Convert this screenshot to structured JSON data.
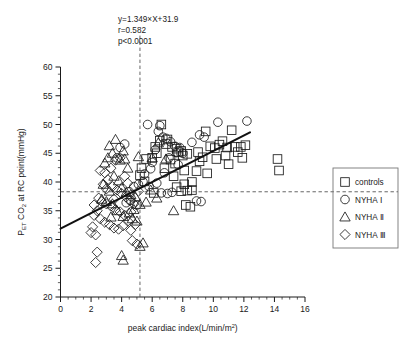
{
  "chart_data": {
    "type": "scatter",
    "title": "",
    "xlabel": "peak cardiac index(L/min/m2)",
    "xlabel_main": "peak cardiac index(L/min/m",
    "xlabel_sup": "2",
    "xlabel_tail": ")",
    "ylabel_pre": "P",
    "ylabel_sub1": "ET",
    "ylabel_mid": " CO",
    "ylabel_sub2": "2",
    "ylabel_tail": " at RC point(mmHg)",
    "xlim": [
      0,
      16
    ],
    "ylim": [
      20,
      60
    ],
    "xticks": [
      0,
      2,
      4,
      6,
      8,
      10,
      12,
      14,
      16
    ],
    "yticks": [
      20,
      25,
      30,
      35,
      40,
      45,
      50,
      55,
      60
    ],
    "xtick_labels": [
      "0",
      "2",
      "4",
      "6",
      "8",
      "10",
      "12",
      "14",
      "16"
    ],
    "ytick_labels": [
      "20",
      "25",
      "30",
      "35",
      "40",
      "45",
      "50",
      "55",
      "60"
    ],
    "minor_tick_step_x": 0.5,
    "minor_tick_step_y": 1.25,
    "grid": false,
    "legend_position": "right-outside",
    "annotations": {
      "equation": "y=1.349×X+31.9",
      "r": "r=0.582",
      "p": "p<0.0001"
    },
    "regression": {
      "slope": 1.349,
      "intercept": 31.9,
      "x_start": 0,
      "x_end": 12.4,
      "color": "#111111",
      "width": 2.1
    },
    "reference_lines": [
      {
        "name": "horizontal-threshold",
        "orientation": "horizontal",
        "value": 38.3,
        "style": "dashed"
      },
      {
        "name": "vertical-threshold",
        "orientation": "vertical",
        "value": 5.2,
        "style": "dashed"
      }
    ],
    "series": [
      {
        "name": "controls",
        "marker": "square",
        "points": [
          [
            6.6,
            50.0
          ],
          [
            6.5,
            47.2
          ],
          [
            6.9,
            46.6
          ],
          [
            7.3,
            46.1
          ],
          [
            7.6,
            45.8
          ],
          [
            7.7,
            45.2
          ],
          [
            7.9,
            45.4
          ],
          [
            8.0,
            44.6
          ],
          [
            8.3,
            44.9
          ],
          [
            7.2,
            43.9
          ],
          [
            7.5,
            43.2
          ],
          [
            6.8,
            42.4
          ],
          [
            8.1,
            42.0
          ],
          [
            8.9,
            41.9
          ],
          [
            9.0,
            45.2
          ],
          [
            9.3,
            44.3
          ],
          [
            9.5,
            48.8
          ],
          [
            9.8,
            46.2
          ],
          [
            10.1,
            45.9
          ],
          [
            10.4,
            46.5
          ],
          [
            10.6,
            47.1
          ],
          [
            10.9,
            46.0
          ],
          [
            11.2,
            49.0
          ],
          [
            11.4,
            46.1
          ],
          [
            11.6,
            45.2
          ],
          [
            11.8,
            46.1
          ],
          [
            11.9,
            44.2
          ],
          [
            12.1,
            46.4
          ],
          [
            10.2,
            44.0
          ],
          [
            9.1,
            43.6
          ],
          [
            8.6,
            40.0
          ],
          [
            8.1,
            39.6
          ],
          [
            8.3,
            38.5
          ],
          [
            7.9,
            38.4
          ],
          [
            8.6,
            38.6
          ],
          [
            8.2,
            36.0
          ],
          [
            8.5,
            35.7
          ],
          [
            14.2,
            44.0
          ],
          [
            14.3,
            42.0
          ],
          [
            6.3,
            45.0
          ],
          [
            6.2,
            46.1
          ],
          [
            7.0,
            47.4
          ],
          [
            7.4,
            41.0
          ],
          [
            9.6,
            41.5
          ],
          [
            10.8,
            44.6
          ],
          [
            11.0,
            43.1
          ],
          [
            6.0,
            44.2
          ],
          [
            5.6,
            44.0
          ],
          [
            5.3,
            42.4
          ],
          [
            5.2,
            41.2
          ],
          [
            5.5,
            40.1
          ],
          [
            6.1,
            38.1
          ],
          [
            7.6,
            39.1
          ]
        ]
      },
      {
        "name": "NYHA Ⅰ",
        "marker": "circle",
        "points": [
          [
            5.7,
            50.0
          ],
          [
            6.5,
            49.8
          ],
          [
            6.4,
            48.8
          ],
          [
            6.9,
            47.6
          ],
          [
            7.2,
            47.0
          ],
          [
            7.5,
            46.2
          ],
          [
            7.6,
            45.1
          ],
          [
            7.8,
            46.0
          ],
          [
            8.0,
            45.0
          ],
          [
            6.2,
            45.6
          ],
          [
            6.0,
            43.4
          ],
          [
            10.3,
            50.4
          ],
          [
            12.2,
            50.6
          ],
          [
            8.6,
            46.9
          ],
          [
            9.1,
            48.2
          ],
          [
            9.4,
            47.8
          ],
          [
            8.9,
            36.7
          ],
          [
            9.2,
            36.6
          ],
          [
            5.9,
            42.3
          ],
          [
            5.5,
            41.4
          ],
          [
            5.4,
            40.0
          ],
          [
            5.1,
            39.6
          ],
          [
            4.8,
            39.2
          ],
          [
            4.5,
            38.3
          ],
          [
            7.3,
            38.2
          ],
          [
            7.0,
            38.0
          ],
          [
            6.6,
            38.1
          ],
          [
            4.2,
            46.6
          ],
          [
            3.9,
            46.0
          ],
          [
            3.7,
            44.2
          ],
          [
            5.8,
            39.2
          ],
          [
            6.3,
            39.8
          ],
          [
            4.6,
            36.8
          ],
          [
            4.3,
            36.4
          ],
          [
            5.0,
            36.0
          ],
          [
            6.8,
            41.6
          ],
          [
            7.1,
            44.2
          ],
          [
            7.7,
            43.0
          ],
          [
            6.7,
            47.8
          ]
        ]
      },
      {
        "name": "NYHA Ⅱ",
        "marker": "triangle",
        "points": [
          [
            3.6,
            47.4
          ],
          [
            3.2,
            46.3
          ],
          [
            3.4,
            45.0
          ],
          [
            4.1,
            45.4
          ],
          [
            3.9,
            43.8
          ],
          [
            4.2,
            44.0
          ],
          [
            5.1,
            44.4
          ],
          [
            4.4,
            42.4
          ],
          [
            3.1,
            44.2
          ],
          [
            2.9,
            43.3
          ],
          [
            3.5,
            41.0
          ],
          [
            3.8,
            40.2
          ],
          [
            4.0,
            39.0
          ],
          [
            4.3,
            38.2
          ],
          [
            4.6,
            37.8
          ],
          [
            4.9,
            37.4
          ],
          [
            5.2,
            36.1
          ],
          [
            4.8,
            35.2
          ],
          [
            4.5,
            34.6
          ],
          [
            4.1,
            34.0
          ],
          [
            3.7,
            35.0
          ],
          [
            3.4,
            36.2
          ],
          [
            3.0,
            36.6
          ],
          [
            2.7,
            37.0
          ],
          [
            6.4,
            46.8
          ],
          [
            6.0,
            44.2
          ],
          [
            6.9,
            44.0
          ],
          [
            5.9,
            38.6
          ],
          [
            6.3,
            37.2
          ],
          [
            7.4,
            35.0
          ],
          [
            4.0,
            27.2
          ],
          [
            4.1,
            26.4
          ],
          [
            5.2,
            28.8
          ],
          [
            5.4,
            29.4
          ],
          [
            4.7,
            33.6
          ],
          [
            5.0,
            33.2
          ],
          [
            3.3,
            33.9
          ],
          [
            5.6,
            36.5
          ],
          [
            2.8,
            39.6
          ],
          [
            3.2,
            38.4
          ]
        ]
      },
      {
        "name": "NYHA Ⅲ",
        "marker": "diamond",
        "points": [
          [
            2.6,
            42.0
          ],
          [
            2.9,
            41.6
          ],
          [
            3.3,
            42.4
          ],
          [
            3.6,
            43.8
          ],
          [
            3.9,
            44.2
          ],
          [
            4.2,
            41.0
          ],
          [
            3.1,
            40.4
          ],
          [
            2.8,
            39.6
          ],
          [
            3.4,
            39.2
          ],
          [
            3.7,
            38.6
          ],
          [
            4.0,
            38.0
          ],
          [
            4.3,
            37.4
          ],
          [
            2.5,
            37.2
          ],
          [
            2.7,
            36.6
          ],
          [
            3.0,
            36.2
          ],
          [
            3.3,
            35.8
          ],
          [
            3.6,
            35.2
          ],
          [
            3.9,
            34.8
          ],
          [
            4.2,
            34.2
          ],
          [
            4.5,
            36.8
          ],
          [
            4.8,
            36.2
          ],
          [
            2.4,
            35.0
          ],
          [
            2.2,
            34.2
          ],
          [
            2.6,
            33.6
          ],
          [
            2.9,
            33.0
          ],
          [
            3.2,
            32.6
          ],
          [
            3.5,
            32.0
          ],
          [
            3.8,
            31.8
          ],
          [
            4.1,
            32.4
          ],
          [
            4.4,
            33.2
          ],
          [
            2.1,
            32.2
          ],
          [
            2.0,
            31.2
          ],
          [
            2.3,
            30.8
          ],
          [
            4.6,
            31.6
          ],
          [
            4.9,
            32.6
          ],
          [
            2.4,
            27.8
          ],
          [
            2.3,
            26.0
          ],
          [
            5.0,
            29.2
          ],
          [
            4.7,
            29.8
          ],
          [
            3.0,
            38.8
          ],
          [
            3.5,
            37.0
          ],
          [
            4.4,
            39.8
          ],
          [
            5.1,
            38.4
          ],
          [
            4.6,
            34.8
          ],
          [
            2.2,
            36.0
          ]
        ]
      }
    ],
    "legend_entries": [
      {
        "label": "controls",
        "marker": "square"
      },
      {
        "label": "NYHA Ⅰ",
        "marker": "circle"
      },
      {
        "label": "NYHA Ⅱ",
        "marker": "triangle"
      },
      {
        "label": "NYHA Ⅲ",
        "marker": "diamond"
      }
    ]
  }
}
